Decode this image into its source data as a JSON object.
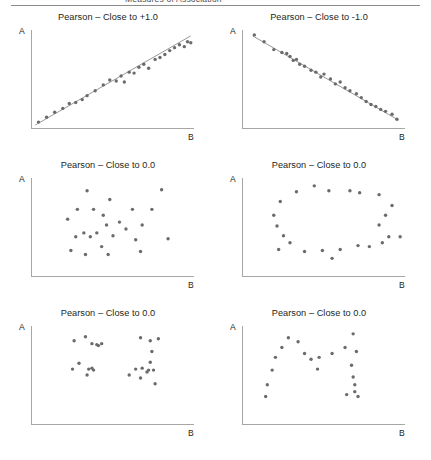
{
  "header": {
    "running_text": "Measures of Association",
    "rule_color": "#8c8c8c"
  },
  "style": {
    "point_color": "#6b6b6b",
    "axis_color": "#a6a6a6",
    "fit_line_color": "#6b6b6b",
    "text_color": "#231f20",
    "background": "#ffffff"
  },
  "axis_labels": {
    "y": "A",
    "x": "B"
  },
  "chart_data": [
    {
      "type": "scatter",
      "panel": "top-left",
      "title": "Pearson – Close to +1.0",
      "xlabel": "B",
      "ylabel": "A",
      "xlim": [
        0,
        100
      ],
      "ylim": [
        0,
        100
      ],
      "grid": false,
      "fit_line": {
        "visible": true,
        "x": [
          2,
          98
        ],
        "y": [
          3,
          94
        ]
      },
      "points": [
        [
          4,
          6
        ],
        [
          9,
          11
        ],
        [
          14,
          16
        ],
        [
          19,
          20
        ],
        [
          23,
          25
        ],
        [
          27,
          26
        ],
        [
          31,
          29
        ],
        [
          34,
          33
        ],
        [
          39,
          38
        ],
        [
          44,
          44
        ],
        [
          48,
          49
        ],
        [
          52,
          48
        ],
        [
          55,
          53
        ],
        [
          57,
          47
        ],
        [
          60,
          57
        ],
        [
          63,
          56
        ],
        [
          66,
          62
        ],
        [
          69,
          65
        ],
        [
          72,
          61
        ],
        [
          76,
          70
        ],
        [
          79,
          72
        ],
        [
          82,
          75
        ],
        [
          85,
          79
        ],
        [
          88,
          82
        ],
        [
          91,
          85
        ],
        [
          94,
          83
        ],
        [
          96,
          88
        ],
        [
          98,
          87
        ]
      ]
    },
    {
      "type": "scatter",
      "panel": "top-right",
      "title": "Pearson – Close to -1.0",
      "xlabel": "B",
      "ylabel": "A",
      "xlim": [
        0,
        100
      ],
      "ylim": [
        0,
        100
      ],
      "grid": false,
      "fit_line": {
        "visible": true,
        "x": [
          6,
          96
        ],
        "y": [
          94,
          8
        ]
      },
      "points": [
        [
          7,
          95
        ],
        [
          13,
          88
        ],
        [
          19,
          80
        ],
        [
          24,
          77
        ],
        [
          27,
          76
        ],
        [
          29,
          73
        ],
        [
          31,
          69
        ],
        [
          33,
          70
        ],
        [
          35,
          65
        ],
        [
          38,
          63
        ],
        [
          42,
          59
        ],
        [
          45,
          57
        ],
        [
          48,
          52
        ],
        [
          50,
          55
        ],
        [
          54,
          50
        ],
        [
          57,
          45
        ],
        [
          60,
          47
        ],
        [
          63,
          41
        ],
        [
          66,
          38
        ],
        [
          70,
          35
        ],
        [
          73,
          31
        ],
        [
          76,
          27
        ],
        [
          79,
          24
        ],
        [
          82,
          22
        ],
        [
          85,
          19
        ],
        [
          88,
          17
        ],
        [
          92,
          14
        ],
        [
          95,
          9
        ]
      ]
    },
    {
      "type": "scatter",
      "panel": "middle-left",
      "title": "Pearson – Close to 0.0",
      "xlabel": "B",
      "ylabel": "A",
      "xlim": [
        0,
        100
      ],
      "ylim": [
        0,
        100
      ],
      "grid": false,
      "fit_line": {
        "visible": false
      },
      "points": [
        [
          34,
          87
        ],
        [
          48,
          78
        ],
        [
          80,
          88
        ],
        [
          28,
          68
        ],
        [
          38,
          68
        ],
        [
          62,
          68
        ],
        [
          74,
          68
        ],
        [
          22,
          58
        ],
        [
          44,
          62
        ],
        [
          46,
          52
        ],
        [
          54,
          55
        ],
        [
          58,
          48
        ],
        [
          32,
          44
        ],
        [
          40,
          44
        ],
        [
          68,
          52
        ],
        [
          27,
          40
        ],
        [
          36,
          40
        ],
        [
          50,
          41
        ],
        [
          64,
          37
        ],
        [
          84,
          38
        ],
        [
          43,
          30
        ],
        [
          24,
          26
        ],
        [
          33,
          22
        ],
        [
          47,
          22
        ],
        [
          67,
          25
        ]
      ]
    },
    {
      "type": "scatter",
      "panel": "middle-right",
      "title": "Pearson – Close to 0.0",
      "xlabel": "B",
      "ylabel": "A",
      "xlim": [
        0,
        100
      ],
      "ylim": [
        0,
        100
      ],
      "grid": false,
      "fit_line": {
        "visible": false
      },
      "points": [
        [
          44,
          92
        ],
        [
          33,
          86
        ],
        [
          53,
          87
        ],
        [
          66,
          87
        ],
        [
          72,
          85
        ],
        [
          84,
          83
        ],
        [
          23,
          76
        ],
        [
          92,
          72
        ],
        [
          19,
          62
        ],
        [
          88,
          62
        ],
        [
          21,
          51
        ],
        [
          84,
          52
        ],
        [
          25,
          41
        ],
        [
          90,
          40
        ],
        [
          97,
          40
        ],
        [
          29,
          34
        ],
        [
          86,
          34
        ],
        [
          22,
          27
        ],
        [
          38,
          25
        ],
        [
          49,
          26
        ],
        [
          60,
          27
        ],
        [
          71,
          31
        ],
        [
          78,
          30
        ],
        [
          55,
          18
        ]
      ]
    },
    {
      "type": "scatter",
      "panel": "bottom-left",
      "title": "Pearson – Close to 0.0",
      "xlabel": "B",
      "ylabel": "A",
      "xlim": [
        0,
        100
      ],
      "ylim": [
        0,
        100
      ],
      "grid": false,
      "fit_line": {
        "visible": false
      },
      "clusters": 4,
      "points": [
        [
          26,
          85
        ],
        [
          33,
          89
        ],
        [
          37,
          82
        ],
        [
          40,
          81
        ],
        [
          41,
          80
        ],
        [
          43,
          82
        ],
        [
          67,
          88
        ],
        [
          73,
          85
        ],
        [
          78,
          87
        ],
        [
          74,
          74
        ],
        [
          25,
          56
        ],
        [
          29,
          62
        ],
        [
          35,
          56
        ],
        [
          37,
          57
        ],
        [
          38,
          55
        ],
        [
          34,
          50
        ],
        [
          64,
          56
        ],
        [
          68,
          57
        ],
        [
          71,
          53
        ],
        [
          72,
          55
        ],
        [
          73,
          63
        ],
        [
          75,
          55
        ],
        [
          60,
          50
        ],
        [
          67,
          47
        ],
        [
          76,
          41
        ]
      ]
    },
    {
      "type": "scatter",
      "panel": "bottom-right",
      "title": "Pearson – Close to 0.0",
      "xlabel": "B",
      "ylabel": "A",
      "xlim": [
        0,
        100
      ],
      "ylim": [
        0,
        100
      ],
      "grid": false,
      "fit_line": {
        "visible": false
      },
      "shape": "M",
      "points": [
        [
          14,
          28
        ],
        [
          15,
          40
        ],
        [
          18,
          55
        ],
        [
          20,
          68
        ],
        [
          24,
          78
        ],
        [
          28,
          88
        ],
        [
          34,
          84
        ],
        [
          38,
          72
        ],
        [
          42,
          66
        ],
        [
          47,
          68
        ],
        [
          46,
          56
        ],
        [
          55,
          72
        ],
        [
          63,
          78
        ],
        [
          68,
          92
        ],
        [
          70,
          74
        ],
        [
          67,
          60
        ],
        [
          68,
          48
        ],
        [
          69,
          40
        ],
        [
          69,
          33
        ],
        [
          64,
          30
        ],
        [
          71,
          28
        ]
      ]
    }
  ]
}
